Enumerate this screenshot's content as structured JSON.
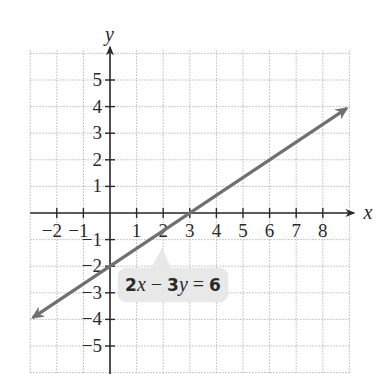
{
  "chart_data": {
    "type": "line",
    "title": "",
    "xlabel": "x",
    "ylabel": "y",
    "xlim": [
      -3,
      9
    ],
    "ylim": [
      -6,
      6
    ],
    "grid": true,
    "grid_style": "dotted",
    "x_ticks": [
      -2,
      -1,
      1,
      2,
      3,
      4,
      5,
      6,
      7,
      8
    ],
    "y_ticks": [
      5,
      4,
      3,
      2,
      1,
      -1,
      -2,
      -3,
      -4,
      -5
    ],
    "x_tick_labels": [
      "−2",
      "−1",
      "1",
      "2",
      "3",
      "4",
      "5",
      "6",
      "7",
      "8"
    ],
    "y_tick_labels": [
      "5",
      "4",
      "3",
      "2",
      "1",
      "−1",
      "−2",
      "−3",
      "−4",
      "−5"
    ],
    "series": [
      {
        "name": "2x − 3y = 6",
        "equation": "2x - 3y = 6",
        "slope": 0.6667,
        "y_intercept": -2,
        "x_intercept": 3,
        "x": [
          -3,
          0,
          3,
          6,
          9
        ],
        "y": [
          -4,
          -2,
          0,
          2,
          4
        ],
        "arrows_both_ends": true,
        "color": "#707070"
      }
    ],
    "annotations": [
      {
        "text": "2x − 3y = 6",
        "position": "below line near x=2..5, y=-3"
      }
    ]
  },
  "labels": {
    "x_axis": "x",
    "y_axis": "y",
    "equation": {
      "coef_x": "2",
      "var_x": "x",
      "minus": " − ",
      "coef_y": "3",
      "var_y": "y",
      "equals": " = ",
      "rhs": "6"
    }
  },
  "colors": {
    "grid": "#b8b8b8",
    "axis": "#2a2a2a",
    "line": "#707070",
    "label_box": "#e8e8e8"
  }
}
